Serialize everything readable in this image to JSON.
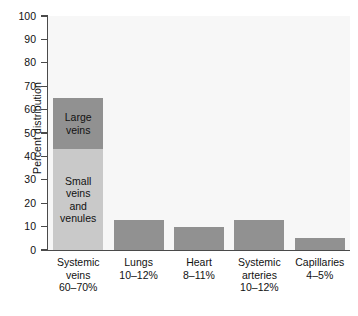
{
  "chart_data": {
    "type": "bar",
    "title": "",
    "subtitle": "",
    "xlabel": "",
    "ylabel": "Percent distribution",
    "ylim": [
      0,
      100
    ],
    "ytick_values": [
      0,
      10,
      20,
      30,
      40,
      50,
      60,
      70,
      80,
      90,
      100
    ],
    "ytick_labels": [
      "0",
      "10",
      "20",
      "30",
      "40",
      "50",
      "60",
      "70",
      "80",
      "90",
      "100"
    ],
    "grid": false,
    "legend": "none",
    "stacked_first_bar": true,
    "categories": [
      "Systemic veins",
      "Lungs",
      "Heart",
      "Systemic arteries",
      "Capillaries"
    ],
    "category_labels": [
      {
        "name": "Systemic\nveins",
        "range": "60–70%"
      },
      {
        "name": "Lungs",
        "range": "10–12%"
      },
      {
        "name": "Heart",
        "range": "8–11%"
      },
      {
        "name": "Systemic\narteries",
        "range": "10–12%"
      },
      {
        "name": "Capillaries",
        "range": "4–5%"
      }
    ],
    "values": [
      65,
      13,
      10,
      13,
      5
    ],
    "series": [
      {
        "name": "Small veins and venules",
        "values": [
          43,
          0,
          0,
          0,
          0
        ],
        "color": "#c9c9c9"
      },
      {
        "name": "Large veins",
        "values": [
          22,
          13,
          10,
          13,
          5
        ],
        "color": "#919191"
      }
    ],
    "segment_annotations": [
      {
        "text": "Large\nveins",
        "bar": 0,
        "segment": 1
      },
      {
        "text": "Small\nveins\nand\nvenules",
        "bar": 0,
        "segment": 0
      }
    ],
    "colors": {
      "dark_gray": "#919191",
      "light_gray": "#c9c9c9",
      "plot_background": "#f7f7f7",
      "axis": "#4a4a4a",
      "text": "#111111"
    }
  },
  "bars": [
    {
      "category": "Systemic veins",
      "range_label": "60–70%",
      "cat_line1": "Systemic",
      "cat_line2": "veins",
      "cat_line3": "60–70%",
      "total": 65,
      "segments": [
        {
          "label_line1": "Small",
          "label_line2": "veins",
          "label_line3": "and",
          "label_line4": "venules",
          "from": 0,
          "to": 43,
          "color": "#c9c9c9"
        },
        {
          "label_line1": "Large",
          "label_line2": "veins",
          "from": 43,
          "to": 65,
          "color": "#919191"
        }
      ]
    },
    {
      "category": "Lungs",
      "range_label": "10–12%",
      "cat_line1": "Lungs",
      "cat_line2": "10–12%",
      "total": 13,
      "segments": [
        {
          "from": 0,
          "to": 13,
          "color": "#919191"
        }
      ]
    },
    {
      "category": "Heart",
      "range_label": "8–11%",
      "cat_line1": "Heart",
      "cat_line2": "8–11%",
      "total": 10,
      "segments": [
        {
          "from": 0,
          "to": 10,
          "color": "#919191"
        }
      ]
    },
    {
      "category": "Systemic arteries",
      "range_label": "10–12%",
      "cat_line1": "Systemic",
      "cat_line2": "arteries",
      "cat_line3": "10–12%",
      "total": 13,
      "segments": [
        {
          "from": 0,
          "to": 13,
          "color": "#919191"
        }
      ]
    },
    {
      "category": "Capillaries",
      "range_label": "4–5%",
      "cat_line1": "Capillaries",
      "cat_line2": "4–5%",
      "total": 5,
      "segments": [
        {
          "from": 0,
          "to": 5,
          "color": "#919191"
        }
      ]
    }
  ],
  "axis": {
    "y_title": "Percent distribution",
    "y_max_label": "100",
    "y_min_label": "0"
  }
}
